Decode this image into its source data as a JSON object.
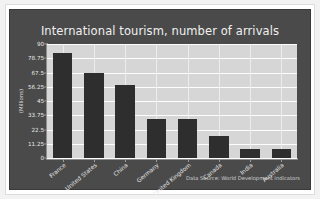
{
  "chart_data": {
    "type": "bar",
    "title": "International tourism, number of arrivals",
    "xlabel": "",
    "ylabel": "(Millions)",
    "categories": [
      "France",
      "United States",
      "China",
      "Germany",
      "United Kingdom",
      "Canada",
      "India",
      "Australia"
    ],
    "values": [
      83.0,
      67.5,
      58.0,
      31.0,
      31.0,
      17.0,
      7.0,
      7.0
    ],
    "ylim": [
      0,
      90
    ],
    "yticks": [
      0,
      11.25,
      22.5,
      33.75,
      45,
      56.25,
      67.5,
      78.75,
      90
    ],
    "ytick_labels": [
      "0",
      "11.25",
      "22.5",
      "33.75",
      "45",
      "56.25",
      "67.5",
      "78.75",
      "90"
    ],
    "grid": true,
    "legend": false,
    "annotation": "Data Source: World Development Indicators",
    "colors": {
      "bar": "#2e2e2e",
      "figure_background": "#4a4a4a",
      "plot_background": "#d6d6d6",
      "gridline": "#fdfdfd",
      "text": "#f0f0f0",
      "page_background": "#ffffff"
    }
  }
}
